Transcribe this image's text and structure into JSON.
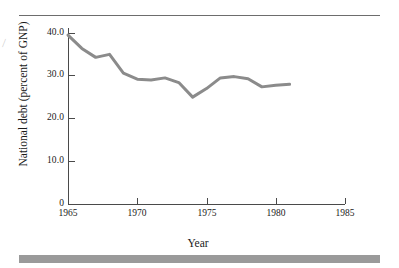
{
  "figure": {
    "top_rule": "true",
    "bottom_bar_color": "#9a9a9a",
    "edge_artifact_glyph": "⁄"
  },
  "chart_data": {
    "type": "line",
    "title": "",
    "xlabel": "Year",
    "ylabel": "National debt (percent of GNP)",
    "xlim": [
      1965,
      1985
    ],
    "ylim": [
      0,
      40
    ],
    "grid": false,
    "legend": null,
    "line_color": "#8b8b8b",
    "line_width_px": 3,
    "xticks": [
      "1965",
      "1970",
      "1975",
      "1980",
      "1985"
    ],
    "xtick_values": [
      1965,
      1970,
      1975,
      1980,
      1985
    ],
    "yticks": [
      "0",
      "10.0",
      "20.0",
      "30.0",
      "40.0"
    ],
    "ytick_values": [
      0,
      10,
      20,
      30,
      40
    ],
    "x": [
      1965,
      1966,
      1967,
      1968,
      1969,
      1970,
      1971,
      1972,
      1973,
      1974,
      1975,
      1976,
      1977,
      1978,
      1979,
      1980,
      1981
    ],
    "series": [
      {
        "name": "National debt (percent of GNP)",
        "values": [
          39.5,
          36.4,
          34.3,
          35.0,
          30.6,
          29.2,
          29.0,
          29.5,
          28.4,
          25.0,
          27.0,
          29.5,
          29.8,
          29.3,
          27.4,
          27.8,
          28.0
        ]
      }
    ]
  }
}
